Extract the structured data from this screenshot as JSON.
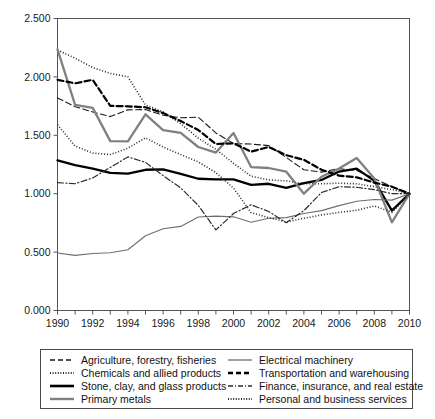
{
  "chart_data": {
    "type": "line",
    "title": "",
    "xlabel": "",
    "ylabel": "",
    "xlim": [
      1990,
      2010
    ],
    "ylim": [
      0.0,
      2.5
    ],
    "grid": false,
    "legend_position": "below",
    "x": [
      1990,
      1991,
      1992,
      1993,
      1994,
      1995,
      1996,
      1997,
      1998,
      1999,
      2000,
      2001,
      2002,
      2003,
      2004,
      2005,
      2006,
      2007,
      2008,
      2009,
      2010
    ],
    "x_tick_labels": [
      "1990",
      "1992",
      "1994",
      "1996",
      "1998",
      "2000",
      "2002",
      "2004",
      "2006",
      "2008",
      "2010"
    ],
    "y_tick_labels": [
      "0.000",
      "0.500",
      "1.000",
      "1.500",
      "2.000",
      "2.500"
    ],
    "y_ticks": [
      0.0,
      0.5,
      1.0,
      1.5,
      2.0,
      2.5
    ],
    "series": [
      {
        "name": "Agriculture, forestry, fisheries",
        "style": "dashed",
        "color": "#1a1a1a",
        "width": 1.1,
        "values": [
          1.82,
          1.745,
          1.7,
          1.66,
          1.718,
          1.72,
          1.672,
          1.65,
          1.655,
          1.52,
          1.43,
          1.425,
          1.412,
          1.31,
          1.205,
          1.185,
          1.215,
          1.198,
          1.13,
          1.06,
          1.0
        ]
      },
      {
        "name": "Chemicals and allied products",
        "style": "dotted",
        "color": "#2a2a2a",
        "width": 1.6,
        "values": [
          2.23,
          2.16,
          2.08,
          2.03,
          2.0,
          1.76,
          1.7,
          1.6,
          1.475,
          1.38,
          1.26,
          1.15,
          1.118,
          1.11,
          1.085,
          1.085,
          1.09,
          1.085,
          1.06,
          1.035,
          1.0
        ]
      },
      {
        "name": "Stone, clay, and glass products",
        "style": "solid",
        "color": "#000000",
        "width": 2.3,
        "values": [
          1.285,
          1.245,
          1.215,
          1.178,
          1.172,
          1.205,
          1.208,
          1.17,
          1.128,
          1.122,
          1.122,
          1.075,
          1.085,
          1.05,
          1.09,
          1.118,
          1.19,
          1.215,
          1.11,
          0.855,
          1.0
        ]
      },
      {
        "name": "Primary metals",
        "style": "solid",
        "color": "#808080",
        "width": 2.3,
        "values": [
          2.235,
          1.76,
          1.735,
          1.45,
          1.448,
          1.68,
          1.545,
          1.52,
          1.4,
          1.352,
          1.52,
          1.228,
          1.22,
          1.188,
          1.0,
          1.145,
          1.215,
          1.305,
          1.13,
          0.755,
          1.0
        ]
      },
      {
        "name": "Electrical machinery",
        "style": "solid",
        "color": "#6e6e6e",
        "width": 1.1,
        "values": [
          0.492,
          0.472,
          0.488,
          0.495,
          0.52,
          0.64,
          0.7,
          0.72,
          0.8,
          0.808,
          0.802,
          0.755,
          0.79,
          0.795,
          0.83,
          0.855,
          0.898,
          0.935,
          0.95,
          0.945,
          1.0
        ]
      },
      {
        "name": "Transportation and warehousing",
        "style": "bold-dashed",
        "color": "#000000",
        "width": 2.2,
        "values": [
          1.975,
          1.945,
          1.975,
          1.752,
          1.748,
          1.74,
          1.69,
          1.622,
          1.545,
          1.425,
          1.432,
          1.36,
          1.4,
          1.33,
          1.29,
          1.205,
          1.155,
          1.14,
          1.095,
          1.06,
          1.0
        ]
      },
      {
        "name": "Finance, insurance, and real estate",
        "style": "dashdot",
        "color": "#2b2b2b",
        "width": 1.2,
        "values": [
          1.095,
          1.085,
          1.135,
          1.225,
          1.315,
          1.268,
          1.155,
          1.05,
          0.9,
          0.69,
          0.83,
          0.905,
          0.848,
          0.752,
          0.855,
          1.01,
          1.06,
          1.055,
          1.035,
          1.0,
          1.0
        ]
      },
      {
        "name": "Personal and business services",
        "style": "dotted",
        "color": "#2a2a2a",
        "width": 1.6,
        "values": [
          1.59,
          1.408,
          1.348,
          1.335,
          1.39,
          1.478,
          1.4,
          1.335,
          1.272,
          1.18,
          1.048,
          0.838,
          0.795,
          0.758,
          0.79,
          0.818,
          0.84,
          0.858,
          0.895,
          0.84,
          1.0
        ]
      }
    ]
  },
  "legend": {
    "columns": [
      {
        "items": [
          {
            "label": "Agriculture, forestry, fisheries",
            "swatch": "dashed-thin"
          },
          {
            "label": "Chemicals and allied products",
            "swatch": "dotted-fine"
          },
          {
            "label": "Stone, clay, and glass products",
            "swatch": "solid-thick-black"
          },
          {
            "label": "Primary metals",
            "swatch": "solid-thick-gray"
          }
        ]
      },
      {
        "items": [
          {
            "label": "Electrical machinery",
            "swatch": "solid-thin-gray"
          },
          {
            "label": "Transportation and warehousing",
            "swatch": "dashed-bold"
          },
          {
            "label": "Finance, insurance, and real estate",
            "swatch": "dashdot-thin"
          },
          {
            "label": "Personal and business services",
            "swatch": "dotted-fine"
          }
        ]
      }
    ]
  },
  "axes": {
    "frame_color": "#555555"
  }
}
